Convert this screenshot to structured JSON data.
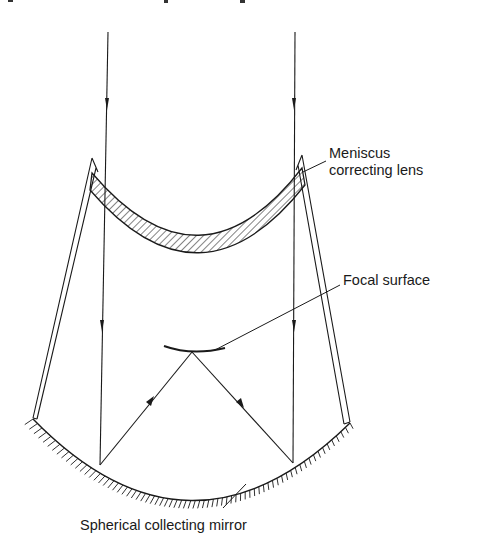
{
  "figure": {
    "title": "",
    "type": "Schmidt camera optical diagram",
    "labels": {
      "lens": [
        "Meniscus",
        "correcting lens"
      ],
      "focal": "Focal surface",
      "mirror": "Spherical collecting mirror"
    },
    "colors": {
      "ink": "#1a1a1a",
      "background": "#ffffff"
    }
  }
}
